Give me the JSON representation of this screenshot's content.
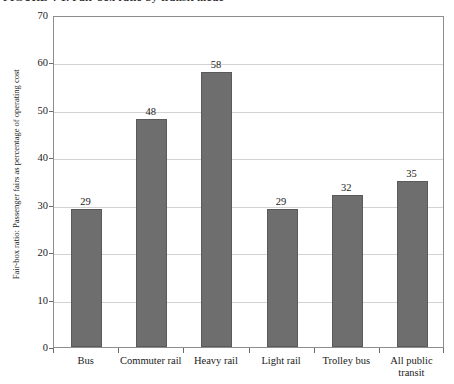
{
  "figure": {
    "title_sliver": "FIGURE 4-1. Fair-box ratio by transit mode",
    "background": "#ffffff",
    "bar_color": "#6e6e6e",
    "bar_edge_color": "#5a5a5a",
    "grid_color": "#d2d2d2",
    "frame_color": "#8d8d8d"
  },
  "chart_data": {
    "type": "bar",
    "title": "",
    "xlabel": "",
    "ylabel": "Fair-box ratio: Passenger fairs as percentage of operating cost",
    "categories": [
      "Bus",
      "Commuter rail",
      "Heavy rail",
      "Light rail",
      "Trolley bus",
      "All public transit"
    ],
    "category_lines": [
      [
        "Bus"
      ],
      [
        "Commuter rail"
      ],
      [
        "Heavy rail"
      ],
      [
        "Light rail"
      ],
      [
        "Trolley bus"
      ],
      [
        "All public",
        "transit"
      ]
    ],
    "values": [
      29,
      48,
      58,
      29,
      32,
      35
    ],
    "value_labels": [
      "29",
      "48",
      "58",
      "29",
      "32",
      "35"
    ],
    "ylim": [
      0,
      70
    ],
    "yticks": [
      0,
      10,
      20,
      30,
      40,
      50,
      60,
      70
    ],
    "ytick_labels": [
      "0",
      "10",
      "20",
      "30",
      "40",
      "50",
      "60",
      "70"
    ],
    "grid": true,
    "grid_axis": "y",
    "legend": false
  }
}
